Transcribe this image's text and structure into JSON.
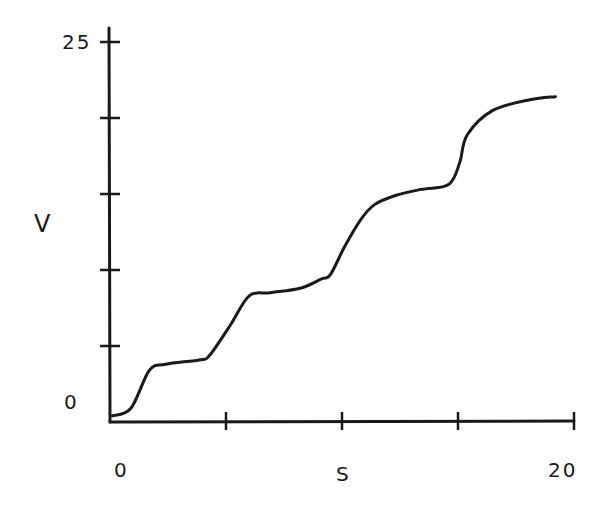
{
  "chart_data": {
    "type": "line",
    "title": "",
    "xlabel": "S",
    "ylabel": "V",
    "xlim": [
      0,
      20
    ],
    "ylim": [
      0,
      25
    ],
    "x_ticks": [
      0,
      5,
      10,
      15,
      20
    ],
    "y_ticks": [
      0,
      5,
      10,
      15,
      20,
      25
    ],
    "x_tick_labels_shown": [
      "0",
      "20"
    ],
    "y_tick_labels_shown": [
      "0",
      "25"
    ],
    "grid": false,
    "legend": null,
    "series": [
      {
        "name": "V vs S",
        "x": [
          0.1,
          0.9,
          1.7,
          2.4,
          3.9,
          4.3,
          5.2,
          6.0,
          6.9,
          8.2,
          9.1,
          9.5,
          10.1,
          10.8,
          11.4,
          12.3,
          13.4,
          14.4,
          14.8,
          15.1,
          15.4,
          16.5,
          18.1,
          19.2
        ],
        "y": [
          0.4,
          0.9,
          3.4,
          3.8,
          4.1,
          4.4,
          6.4,
          8.3,
          8.5,
          8.8,
          9.4,
          9.7,
          11.5,
          13.3,
          14.3,
          14.9,
          15.3,
          15.5,
          16.0,
          17.2,
          18.9,
          20.5,
          21.2,
          21.4
        ]
      }
    ]
  },
  "labels": {
    "y_top": "25",
    "y_bottom": "0",
    "x_left": "0",
    "x_right": "20",
    "x_axis": "S",
    "y_axis": "V"
  },
  "colors": {
    "ink": "#1a1a1a",
    "background": "#ffffff"
  }
}
